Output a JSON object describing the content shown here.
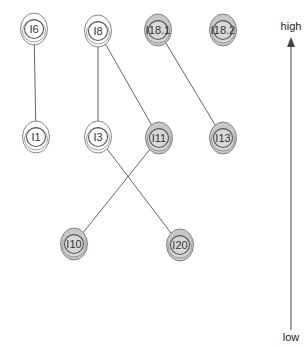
{
  "diagram": {
    "type": "hierarchy-graph",
    "nodes": [
      {
        "id": "I6",
        "label": "I6",
        "x": 34,
        "y": 29,
        "filled": false
      },
      {
        "id": "I8",
        "label": "I8",
        "x": 98,
        "y": 31,
        "filled": false
      },
      {
        "id": "I18.1",
        "label": "I18.1",
        "x": 158,
        "y": 30,
        "filled": true
      },
      {
        "id": "I18.2",
        "label": "I18.2",
        "x": 223,
        "y": 30,
        "filled": true
      },
      {
        "id": "I1",
        "label": "I1",
        "x": 36,
        "y": 137,
        "filled": false
      },
      {
        "id": "I3",
        "label": "I3",
        "x": 98,
        "y": 137,
        "filled": false
      },
      {
        "id": "I11",
        "label": "I11",
        "x": 159,
        "y": 138,
        "filled": true
      },
      {
        "id": "I13",
        "label": "I13",
        "x": 223,
        "y": 138,
        "filled": true
      },
      {
        "id": "I10",
        "label": "I10",
        "x": 74,
        "y": 244,
        "filled": true
      },
      {
        "id": "I20",
        "label": "I20",
        "x": 180,
        "y": 245,
        "filled": true
      }
    ],
    "edges": [
      {
        "from": "I6",
        "to": "I1"
      },
      {
        "from": "I8",
        "to": "I3"
      },
      {
        "from": "I8",
        "to": "I11"
      },
      {
        "from": "I18.1",
        "to": "I13"
      },
      {
        "from": "I3",
        "to": "I20"
      },
      {
        "from": "I11",
        "to": "I10"
      }
    ],
    "axis": {
      "high_label": "high",
      "low_label": "low",
      "x": 291,
      "top_y": 37,
      "bottom_y": 330
    },
    "colors": {
      "fill": "#c8c8c8",
      "ring": "#777777",
      "edge": "#555555"
    }
  }
}
